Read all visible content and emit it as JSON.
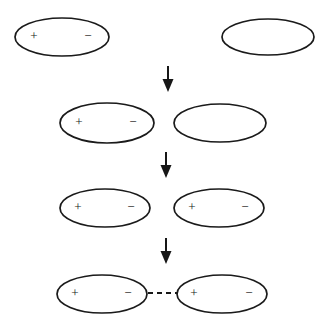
{
  "figure": {
    "background_color": "#ffffff",
    "stroke_color": "#1a1a1a",
    "width": 331,
    "height": 321
  },
  "labels": {
    "plus": "+",
    "minus": "−"
  },
  "stages": [
    {
      "id": "stage-1",
      "row_index": 1,
      "shapes": [
        {
          "id": "stage1-left-ellipse",
          "name": "polarized-ellipse",
          "cx": 62,
          "cy": 37,
          "rx": 47,
          "ry": 19,
          "polarized": true,
          "plus_x": 34,
          "minus_x": 88,
          "sign_y": 37
        },
        {
          "id": "stage1-right-ellipse",
          "name": "neutral-ellipse",
          "cx": 268,
          "cy": 37,
          "rx": 46,
          "ry": 18,
          "polarized": false
        }
      ]
    },
    {
      "id": "stage-2",
      "row_index": 2,
      "shapes": [
        {
          "id": "stage2-left-ellipse",
          "name": "polarized-ellipse",
          "cx": 107,
          "cy": 123,
          "rx": 47,
          "ry": 20,
          "polarized": true,
          "plus_x": 79,
          "minus_x": 133,
          "sign_y": 123
        },
        {
          "id": "stage2-right-ellipse",
          "name": "neutral-ellipse",
          "cx": 220,
          "cy": 123,
          "rx": 46,
          "ry": 19,
          "polarized": false
        }
      ]
    },
    {
      "id": "stage-3",
      "row_index": 3,
      "shapes": [
        {
          "id": "stage3-left-ellipse",
          "name": "polarized-ellipse",
          "cx": 105,
          "cy": 208,
          "rx": 45,
          "ry": 19,
          "polarized": true,
          "plus_x": 78,
          "minus_x": 131,
          "sign_y": 208
        },
        {
          "id": "stage3-right-ellipse",
          "name": "polarized-ellipse",
          "cx": 219,
          "cy": 208,
          "rx": 45,
          "ry": 19,
          "polarized": true,
          "plus_x": 192,
          "minus_x": 245,
          "sign_y": 208
        }
      ]
    },
    {
      "id": "stage-4",
      "row_index": 4,
      "shapes": [
        {
          "id": "stage4-left-ellipse",
          "name": "polarized-ellipse",
          "cx": 102,
          "cy": 294,
          "rx": 45,
          "ry": 19,
          "polarized": true,
          "plus_x": 75,
          "minus_x": 128,
          "sign_y": 294
        },
        {
          "id": "stage4-right-ellipse",
          "name": "polarized-ellipse",
          "cx": 222,
          "cy": 294,
          "rx": 45,
          "ry": 19,
          "polarized": true,
          "plus_x": 194,
          "minus_x": 249,
          "sign_y": 294
        }
      ],
      "connector": {
        "id": "stage4-dashed-connector",
        "name": "dashed-interaction-line",
        "x1": 148,
        "x2": 178,
        "y": 293
      }
    }
  ],
  "arrows": [
    {
      "id": "arrow-1",
      "name": "down-arrow",
      "x": 168,
      "y_start": 66,
      "y_end": 92
    },
    {
      "id": "arrow-2",
      "name": "down-arrow",
      "x": 166,
      "y_start": 152,
      "y_end": 178
    },
    {
      "id": "arrow-3",
      "name": "down-arrow",
      "x": 166,
      "y_start": 238,
      "y_end": 264
    }
  ]
}
